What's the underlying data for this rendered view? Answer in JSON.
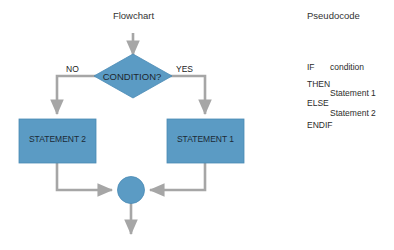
{
  "diagram": {
    "background_color": "#ffffff",
    "shape_fill": "#5b9bc4",
    "shape_stroke": "#4a8ab5",
    "connector_color": "#a6a6a6"
  },
  "flowchart": {
    "title": "Flowchart",
    "decision": {
      "text": "CONDITION?",
      "branch_no_label": "NO",
      "branch_yes_label": "YES"
    },
    "statement_left": "STATEMENT  2",
    "statement_right": "STATEMENT 1",
    "merge_node": ""
  },
  "pseudocode": {
    "title": "Pseudocode",
    "lines": [
      {
        "keyword": "IF",
        "indented": "condition"
      },
      {
        "keyword": "THEN",
        "indented": ""
      },
      {
        "keyword": "",
        "indented": "Statement 1"
      },
      {
        "keyword": "ELSE",
        "indented": ""
      },
      {
        "keyword": "",
        "indented": "Statement 2"
      },
      {
        "keyword": "ENDIF",
        "indented": ""
      }
    ],
    "line_if_kw": "IF",
    "line_if_val": "condition",
    "line_then": "THEN",
    "line_stmt1": "Statement 1",
    "line_else": "ELSE",
    "line_stmt2": "Statement 2",
    "line_endif": "ENDIF"
  }
}
